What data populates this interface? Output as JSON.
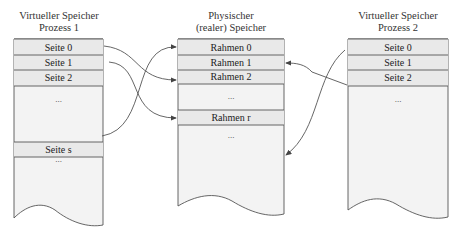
{
  "diagram": {
    "left": {
      "title_line1": "Virtueller Speicher",
      "title_line2": "Prozess 1",
      "rows": [
        "Seite 0",
        "Seite 1",
        "Seite 2",
        "...",
        "Seite s",
        "..."
      ]
    },
    "middle": {
      "title_line1": "Physischer",
      "title_line2": "(realer) Speicher",
      "rows": [
        "Rahmen 0",
        "Rahmen 1",
        "Rahmen 2",
        "...",
        "Rahmen r",
        "..."
      ]
    },
    "right": {
      "title_line1": "Virtueller Speicher",
      "title_line2": "Prozess 2",
      "rows": [
        "Seite 0",
        "Seite 1",
        "Seite 2",
        "..."
      ]
    },
    "mappings": [
      {
        "from": "Prozess 1 / Seite 0",
        "to": "Rahmen 2"
      },
      {
        "from": "Prozess 1 / Seite 1",
        "to": "Rahmen r"
      },
      {
        "from": "Prozess 1 / Seite s",
        "to": "Rahmen 0"
      },
      {
        "from": "Prozess 2 / Seite 2",
        "to": "Rahmen 1"
      },
      {
        "from": "Prozess 2 / Seite 0",
        "to": "Rahmen (unterer Bereich)"
      }
    ],
    "colors": {
      "fill": "#f2f2f2",
      "row_fill": "#e8e8e8",
      "stroke": "#555555"
    }
  }
}
